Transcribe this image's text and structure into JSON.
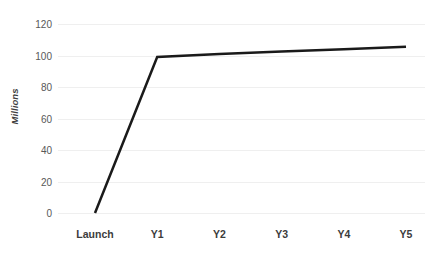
{
  "chart_data": {
    "type": "line",
    "title": "",
    "subtitle": "",
    "xlabel": "",
    "ylabel": "Millions",
    "categories": [
      "Launch",
      "Y1",
      "Y2",
      "Y3",
      "Y4",
      "Y5"
    ],
    "series": [
      {
        "name": "Users",
        "values": [
          0,
          99,
          101,
          102.5,
          104,
          105.5
        ],
        "color": "#1a1a1a",
        "line_width": 2.5
      }
    ],
    "ylim": [
      0,
      120
    ],
    "y_ticks": [
      0,
      20,
      40,
      60,
      80,
      100,
      120
    ],
    "y_tick_labels": [
      "0",
      "20",
      "40",
      "60",
      "80",
      "100",
      "120"
    ],
    "x_tick_labels": [
      "Launch",
      "Y1",
      "Y2",
      "Y3",
      "Y4",
      "Y5"
    ],
    "grid": {
      "horizontal": true,
      "vertical": false,
      "color": "#efefef"
    },
    "legend": {
      "visible": false,
      "position": "none"
    },
    "axis_lines": {
      "x_visible": false,
      "y_visible": false
    },
    "background_color": "#ffffff",
    "annotations": []
  }
}
